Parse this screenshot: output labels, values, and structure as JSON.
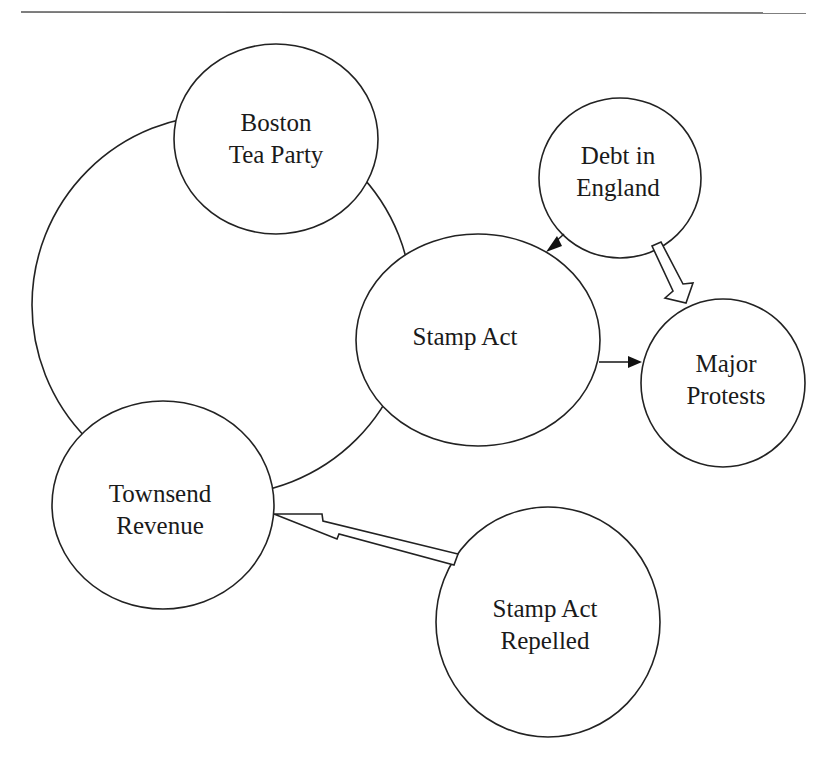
{
  "diagram": {
    "nodes": [
      {
        "id": "boston",
        "line1": "Boston",
        "line2": "Tea Party"
      },
      {
        "id": "debt",
        "line1": "Debt in",
        "line2": "England"
      },
      {
        "id": "stamp",
        "line1": "Stamp Act",
        "line2": ""
      },
      {
        "id": "protests",
        "line1": "Major",
        "line2": "Protests"
      },
      {
        "id": "townsend",
        "line1": "Townsend",
        "line2": "Revenue"
      },
      {
        "id": "repelled",
        "line1": "Stamp Act",
        "line2": "Repelled"
      }
    ],
    "edges": [
      {
        "from": "Debt in England",
        "to": "Stamp Act",
        "style": "solid-arrow"
      },
      {
        "from": "Debt in England",
        "to": "Major Protests",
        "style": "hollow-block-arrow"
      },
      {
        "from": "Stamp Act",
        "to": "Major Protests",
        "style": "solid-arrow"
      },
      {
        "from": "Stamp Act Repelled",
        "to": "Townsend Revenue",
        "style": "hollow-block-arrow"
      }
    ],
    "colors": {
      "stroke": "#222222",
      "background": "#ffffff"
    }
  }
}
